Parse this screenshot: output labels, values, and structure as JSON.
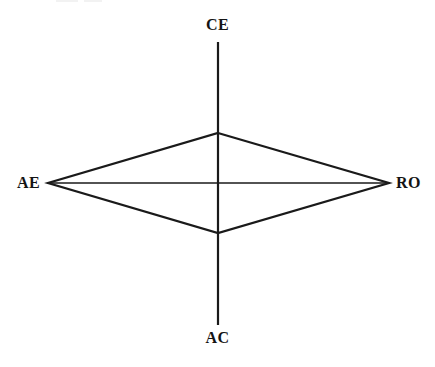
{
  "figure": {
    "kind": "kolb-learning-style-radar",
    "background_color": "#ffffff",
    "line_color": "#1a1a1a",
    "width": 435,
    "height": 367
  },
  "axes": {
    "top": {
      "id": "CE",
      "label": "CE"
    },
    "bottom": {
      "id": "AC",
      "label": "AC"
    },
    "left": {
      "id": "AE",
      "label": "AE"
    },
    "right": {
      "id": "RO",
      "label": "RO"
    }
  },
  "chart_data": {
    "type": "radar",
    "title": "",
    "subtitle": "",
    "xlabel": "",
    "ylabel": "",
    "grid": false,
    "legend": null,
    "center": {
      "x": 218,
      "y": 183
    },
    "categories": [
      "CE",
      "RO",
      "AC",
      "AE"
    ],
    "axis_directions": {
      "CE": "up",
      "RO": "right",
      "AC": "down",
      "AE": "left"
    },
    "axis_extents_px": {
      "CE": {
        "x": 218,
        "y": 42
      },
      "RO": {
        "x": 389,
        "y": 183
      },
      "AC": {
        "x": 218,
        "y": 325
      },
      "AE": {
        "x": 48,
        "y": 183
      }
    },
    "series": [
      {
        "name": "profile",
        "vertices_px": [
          {
            "axis": "CE",
            "x": 218,
            "y": 133
          },
          {
            "axis": "RO",
            "x": 389,
            "y": 183
          },
          {
            "axis": "AC",
            "x": 218,
            "y": 233
          },
          {
            "axis": "AE",
            "x": 48,
            "y": 183
          }
        ],
        "values_px_from_center": [
          50,
          171,
          50,
          170
        ],
        "closed": true,
        "filled": false
      }
    ],
    "annotations": []
  },
  "geometry": {
    "vertical_axis": {
      "x": 218,
      "y1": 42,
      "y2": 325,
      "stroke_width": 2.2
    },
    "horizontal_axis": {
      "y": 183,
      "x1": 48,
      "x2": 389,
      "stroke_width": 1.5
    },
    "polygon_points": "218,133 389,183 218,233 48,183",
    "polygon_stroke_width": 2.2
  }
}
